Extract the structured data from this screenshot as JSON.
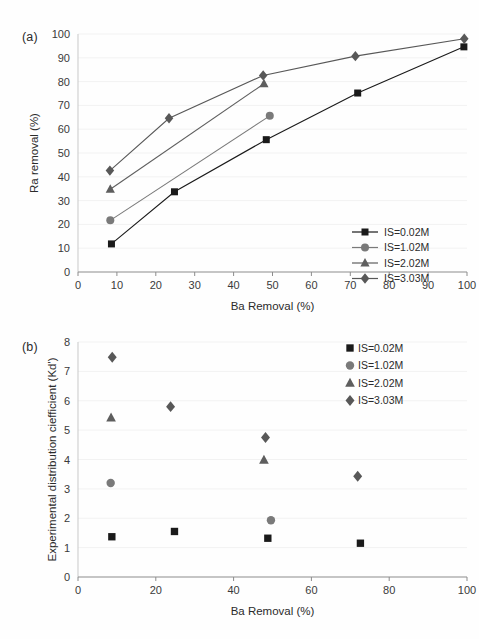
{
  "figure": {
    "panel_a_tag": "(a)",
    "panel_b_tag": "(b)"
  },
  "series_colors": {
    "is_002": "#1a1a1a",
    "is_102": "#7a7a7a",
    "is_202": "#5e5e5e",
    "is_303": "#585858"
  },
  "chart_data": [
    {
      "id": "chart-a",
      "type": "line",
      "title": "(a)",
      "xlabel": "Ba Removal (%)",
      "ylabel": "Ra removal (%)",
      "xlim": [
        0,
        100
      ],
      "ylim": [
        0,
        100
      ],
      "xticks": [
        0,
        10,
        20,
        30,
        40,
        50,
        60,
        70,
        80,
        90,
        100
      ],
      "yticks": [
        0,
        10,
        20,
        30,
        40,
        50,
        60,
        70,
        80,
        90,
        100
      ],
      "grid": "horizontal",
      "legend_position": "bottom-right",
      "legend_style": "line-with-marker",
      "series": [
        {
          "name": "IS=0.02M",
          "marker": "square",
          "color": "#1a1a1a",
          "x": [
            8.6,
            24.8,
            48.4,
            71.9,
            99.2
          ],
          "y": [
            11.8,
            33.7,
            55.6,
            75.2,
            94.6
          ]
        },
        {
          "name": "IS=1.02M",
          "marker": "circle",
          "color": "#7a7a7a",
          "x": [
            8.3,
            49.3
          ],
          "y": [
            21.7,
            65.6
          ]
        },
        {
          "name": "IS=2.02M",
          "marker": "triangle",
          "color": "#5e5e5e",
          "x": [
            8.3,
            47.8
          ],
          "y": [
            34.8,
            79.1
          ]
        },
        {
          "name": "IS=3.03M",
          "marker": "diamond",
          "color": "#585858",
          "x": [
            8.2,
            23.4,
            47.6,
            71.3,
            99.3
          ],
          "y": [
            42.6,
            64.6,
            82.6,
            90.7,
            98.0
          ]
        }
      ]
    },
    {
      "id": "chart-b",
      "type": "scatter",
      "title": "(b)",
      "xlabel": "Ba Removal (%)",
      "ylabel": "Experimental distribution ciefficient (Kd')",
      "xlim": [
        0,
        100
      ],
      "ylim": [
        0,
        8
      ],
      "xticks": [
        0,
        20,
        40,
        60,
        80,
        100
      ],
      "yticks": [
        0,
        1,
        2,
        3,
        4,
        5,
        6,
        7,
        8
      ],
      "grid": "horizontal",
      "legend_position": "top-right",
      "legend_style": "marker-only",
      "series": [
        {
          "name": "IS=0.02M",
          "marker": "square",
          "color": "#1a1a1a",
          "x": [
            8.7,
            24.8,
            48.8,
            72.6
          ],
          "y": [
            1.37,
            1.55,
            1.32,
            1.15
          ]
        },
        {
          "name": "IS=1.02M",
          "marker": "circle",
          "color": "#7a7a7a",
          "x": [
            8.4,
            49.6
          ],
          "y": [
            3.2,
            1.93
          ]
        },
        {
          "name": "IS=2.02M",
          "marker": "triangle",
          "color": "#5e5e5e",
          "x": [
            8.5,
            47.8
          ],
          "y": [
            5.42,
            3.98
          ]
        },
        {
          "name": "IS=3.03M",
          "marker": "diamond",
          "color": "#585858",
          "x": [
            8.8,
            23.8,
            48.2,
            71.9
          ],
          "y": [
            7.48,
            5.8,
            4.75,
            3.43
          ]
        }
      ]
    }
  ]
}
